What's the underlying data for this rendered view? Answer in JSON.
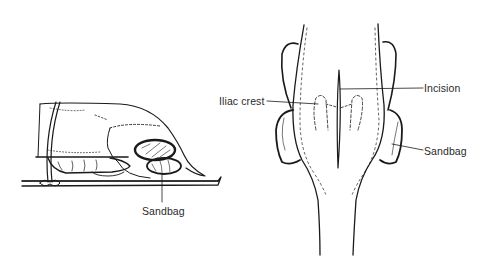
{
  "figure": {
    "panels": [
      {
        "id": "lateral-view",
        "description": "Side view of animal lying prone on table, strapped, with sandbag under hindquarters",
        "labels": [
          {
            "key": "sandbag",
            "text": "Sandbag"
          }
        ]
      },
      {
        "id": "dorsal-view",
        "description": "Dorsal view of hindquarters showing iliac crests, midline incision and sandbags",
        "labels": [
          {
            "key": "iliac_crest",
            "text": "Iliac crest"
          },
          {
            "key": "incision",
            "text": "Incision"
          },
          {
            "key": "sandbag",
            "text": "Sandbag"
          }
        ]
      }
    ],
    "colors": {
      "line": "#1a1a1a",
      "background": "#ffffff",
      "label": "#2a2a2a"
    }
  },
  "labels": {
    "left_sandbag": "Sandbag",
    "iliac_crest": "Iliac crest",
    "incision": "Incision",
    "right_sandbag": "Sandbag"
  }
}
